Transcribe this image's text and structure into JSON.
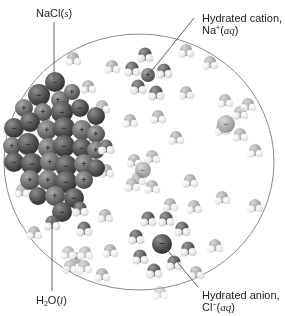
{
  "figure": {
    "labels": {
      "nacl": {
        "formula": "NaCl",
        "state": "s"
      },
      "cation": {
        "title": "Hydrated cation,",
        "ion": "Na",
        "charge": "+",
        "state": "aq"
      },
      "anion": {
        "title": "Hydrated anion,",
        "ion": "Cl",
        "charge": "−",
        "state": "aq"
      },
      "water": {
        "h": "H",
        "sub": "2",
        "o": "O",
        "state": "l"
      }
    },
    "ion_symbols": {
      "plus": "+",
      "minus": "−"
    },
    "colors": {
      "chloride": "#5a5a5a",
      "sodium": "#7a7a7a",
      "oxygen": "#9a9a9a",
      "hydrogen": "#e6e6e6",
      "circle": "#8a8a8a",
      "leader": "#555555"
    }
  }
}
